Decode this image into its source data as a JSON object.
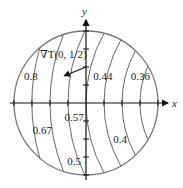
{
  "diagram": {
    "type": "contour-map",
    "axes": {
      "x_label": "x",
      "y_label": "y",
      "tick_spacing": 0.25,
      "ticks_per_half_axis": 4
    },
    "boundary": {
      "shape": "circle",
      "radius": 1,
      "center": [
        0,
        0
      ]
    },
    "isotherm_center": [
      2,
      0
    ],
    "isotherms": [
      {
        "value": "0.8",
        "x_intercept": -0.75,
        "label_pos": [
          -0.86,
          0.38
        ]
      },
      {
        "value": "0.67",
        "x_intercept": -0.5,
        "label_pos": [
          -0.74,
          -0.38
        ]
      },
      {
        "value": "0.57",
        "x_intercept": -0.25,
        "label_pos": [
          -0.3,
          -0.2
        ]
      },
      {
        "value": "0.5",
        "x_intercept": 0,
        "label_pos": [
          -0.26,
          -0.8
        ]
      },
      {
        "value": "0.44",
        "x_intercept": 0.25,
        "label_pos": [
          0.1,
          0.38
        ]
      },
      {
        "value": "0.4",
        "x_intercept": 0.5,
        "label_pos": [
          0.38,
          -0.5
        ]
      },
      {
        "value": "0.36",
        "x_intercept": 0.75,
        "label_pos": [
          0.62,
          0.37
        ]
      }
    ],
    "gradient": {
      "label": "∇T(0, 1/2)",
      "from": [
        0,
        0.5
      ],
      "to": [
        -0.3,
        0.38
      ]
    }
  },
  "colors": {
    "boundary": "#777777",
    "contour": "#555555",
    "axis": "#111111",
    "text": "#222222"
  }
}
